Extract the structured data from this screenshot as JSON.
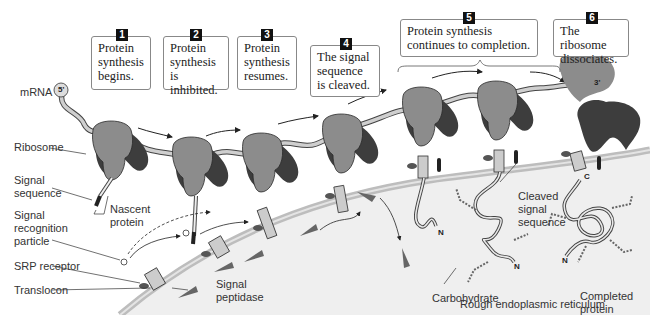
{
  "steps": [
    {
      "num": "1",
      "text": "Protein synthesis begins."
    },
    {
      "num": "2",
      "text": "Protein synthesis is inhibited."
    },
    {
      "num": "3",
      "text": "Protein synthesis resumes."
    },
    {
      "num": "4",
      "text": "The signal sequence is cleaved."
    },
    {
      "num": "5",
      "text": "Protein synthesis continues to completion."
    },
    {
      "num": "6",
      "text": "The ribosome dissociates."
    }
  ],
  "labels": {
    "mrna": "mRNA",
    "five_prime": "5'",
    "three_prime": "3'",
    "ribosome": "Ribosome",
    "signal_sequence": "Signal sequence",
    "nascent_protein": "Nascent protein",
    "srp": "Signal recognition particle",
    "srp_receptor": "SRP receptor",
    "translocon": "Translocon",
    "signal_peptidase": "Signal peptidase",
    "cleaved_signal_sequence": "Cleaved signal sequence",
    "carbohydrate": "Carbohydrate",
    "completed_protein": "Completed protein",
    "rough_er": "Rough endoplasmic reticulum",
    "n_terminus": "N",
    "c_terminus": "C"
  },
  "colors": {
    "ribosome_small": "#8c8c8c",
    "ribosome_large": "#3d3d3d",
    "mrna": "#c8c8c8",
    "er_lumen": "#ececec",
    "membrane": "#c4c4c4"
  }
}
